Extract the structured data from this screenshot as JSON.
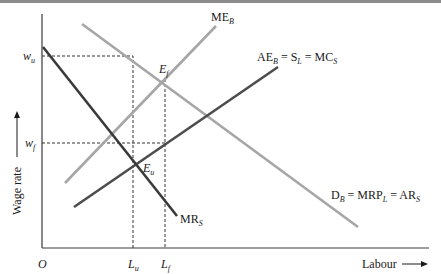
{
  "figure": {
    "axes": {
      "y_label": "Wage rate",
      "x_label": "Labour",
      "origin": "O"
    },
    "y_ticks": [
      {
        "name": "w_u",
        "base": "w",
        "sub": "u"
      },
      {
        "name": "w_f",
        "base": "w",
        "sub": "f"
      }
    ],
    "x_ticks": [
      {
        "name": "L_u",
        "base": "L",
        "sub": "u"
      },
      {
        "name": "L_f",
        "base": "L",
        "sub": "f"
      }
    ],
    "curves": [
      {
        "id": "ME_B",
        "label_parts": [
          "ME",
          "B"
        ],
        "color": "#a6a6a6"
      },
      {
        "id": "AE_B",
        "label_parts": [
          "AE",
          "B",
          " = S",
          "L",
          " = MC",
          "S"
        ],
        "color": "#4d4d4d"
      },
      {
        "id": "D_B",
        "label_parts": [
          "D",
          "B",
          " = MRP",
          "L",
          " = AR",
          "S"
        ],
        "color": "#a6a6a6"
      },
      {
        "id": "MR_S",
        "label_parts": [
          "MR",
          "S"
        ],
        "color": "#3a3a3a"
      }
    ],
    "points": [
      {
        "id": "E_f",
        "base": "E",
        "sub": "f"
      },
      {
        "id": "E_u",
        "base": "E",
        "sub": "u"
      }
    ],
    "colors": {
      "axis": "#3a3a3a",
      "light_curve": "#a6a6a6",
      "dark_curve": "#4d4d4d",
      "mr_curve": "#3a3a3a",
      "dashed": "#333333"
    }
  }
}
